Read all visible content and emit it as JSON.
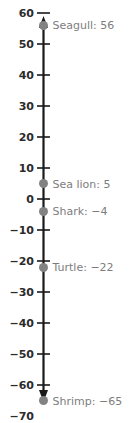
{
  "chart_data": {
    "type": "scatter",
    "orientation": "vertical-number-line",
    "title": "",
    "xlabel": "",
    "ylabel": "",
    "ylim": [
      -75,
      63
    ],
    "grid": false,
    "legend": "none",
    "axis_color": "#1a1a1a",
    "point_color": "#828282",
    "label_color": "#7d7d7d",
    "tick_label_color": "#2b2b2b",
    "tick_step": 10,
    "tick_labels": [
      "60",
      "50",
      "40",
      "30",
      "20",
      "10",
      "0",
      "−10",
      "−20",
      "−30",
      "−40",
      "−50",
      "−60",
      "−70"
    ],
    "tick_values": [
      60,
      50,
      40,
      30,
      20,
      10,
      0,
      -10,
      -20,
      -30,
      -40,
      -50,
      -60,
      -70
    ],
    "points": [
      {
        "name": "Seagull",
        "value": 56,
        "label": "Seagull: 56"
      },
      {
        "name": "Sea lion",
        "value": 5,
        "label": "Sea lion: 5"
      },
      {
        "name": "Shark",
        "value": -4,
        "label": "Shark: −4"
      },
      {
        "name": "Turtle",
        "value": -22,
        "label": "Turtle: −22"
      },
      {
        "name": "Shrimp",
        "value": -65,
        "label": "Shrimp: −65"
      }
    ]
  }
}
